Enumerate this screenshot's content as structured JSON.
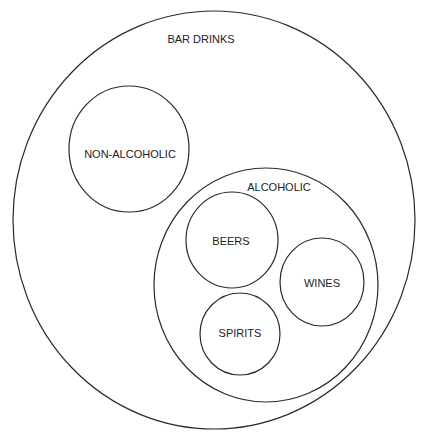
{
  "diagram": {
    "type": "nested-venn",
    "colors": {
      "stroke": "#2a2a2a",
      "text": "#222222",
      "background": "#ffffff"
    },
    "sets": [
      {
        "id": "bar-drinks",
        "label": "BAR DRINKS",
        "parent": null
      },
      {
        "id": "non-alcoholic",
        "label": "NON-ALCOHOLIC",
        "parent": "bar-drinks"
      },
      {
        "id": "alcoholic",
        "label": "ALCOHOLIC",
        "parent": "bar-drinks"
      },
      {
        "id": "beers",
        "label": "BEERS",
        "parent": "alcoholic"
      },
      {
        "id": "wines",
        "label": "WINES",
        "parent": "alcoholic"
      },
      {
        "id": "spirits",
        "label": "SPIRITS",
        "parent": "alcoholic"
      }
    ]
  }
}
